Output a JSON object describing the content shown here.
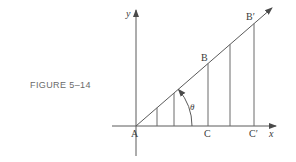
{
  "caption": "FIGURE 5–14",
  "labels": {
    "y_axis": "y",
    "x_axis": "x",
    "origin": "A",
    "point_B": "B",
    "point_B_prime": "B′",
    "point_C": "C",
    "point_C_prime": "C′",
    "angle": "θ"
  },
  "colors": {
    "line": "#5a5a5a",
    "text": "#3a3a3a",
    "caption": "#6a6a6a"
  }
}
